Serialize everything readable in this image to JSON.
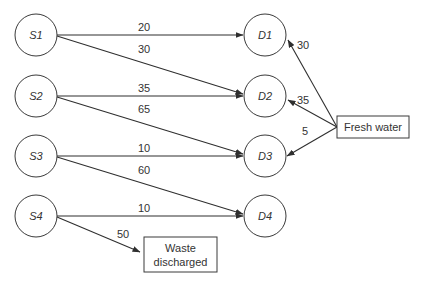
{
  "diagram": {
    "type": "water-network-flow",
    "sources": [
      {
        "id": "S1",
        "label": "S1"
      },
      {
        "id": "S2",
        "label": "S2"
      },
      {
        "id": "S3",
        "label": "S3"
      },
      {
        "id": "S4",
        "label": "S4"
      }
    ],
    "sinks": [
      {
        "id": "D1",
        "label": "D1"
      },
      {
        "id": "D2",
        "label": "D2"
      },
      {
        "id": "D3",
        "label": "D3"
      },
      {
        "id": "D4",
        "label": "D4"
      }
    ],
    "fresh_water": {
      "label": "Fresh water"
    },
    "waste": {
      "label_line1": "Waste",
      "label_line2": "discharged"
    },
    "edges": [
      {
        "from": "S1",
        "to": "D1",
        "value": "20"
      },
      {
        "from": "S1",
        "to": "D2",
        "value": "30"
      },
      {
        "from": "S2",
        "to": "D2",
        "value": "35"
      },
      {
        "from": "S2",
        "to": "D3",
        "value": "65"
      },
      {
        "from": "S3",
        "to": "D3",
        "value": "10"
      },
      {
        "from": "S3",
        "to": "D4",
        "value": "60"
      },
      {
        "from": "S4",
        "to": "D4",
        "value": "10"
      },
      {
        "from": "S4",
        "to": "Waste discharged",
        "value": "50"
      },
      {
        "from": "Fresh water",
        "to": "D1",
        "value": "30"
      },
      {
        "from": "Fresh water",
        "to": "D2",
        "value": "35"
      },
      {
        "from": "Fresh water",
        "to": "D3",
        "value": "5"
      }
    ]
  }
}
